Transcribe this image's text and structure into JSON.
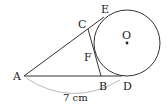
{
  "diagram": {
    "points": {
      "A": "A",
      "B": "B",
      "C": "C",
      "D": "D",
      "E": "E",
      "F": "F",
      "O": "O"
    },
    "measurement": "7 cm",
    "colors": {
      "stroke": "#333333",
      "arc": "#bbbbbb"
    }
  }
}
